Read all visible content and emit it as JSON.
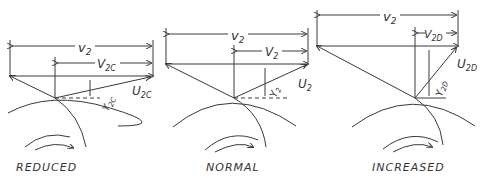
{
  "diagrams": [
    {
      "caption": "REDUCED",
      "labels": {
        "v2": "v",
        "v2_sub": "2",
        "V": "V",
        "V_sub": "2C",
        "U": "U",
        "U_sub": "2C",
        "Y": "Y",
        "Y_sub": "2C"
      }
    },
    {
      "caption": "NORMAL",
      "labels": {
        "v2": "v",
        "v2_sub": "2",
        "V": "V",
        "V_sub": "2",
        "U": "U",
        "U_sub": "2",
        "Y": "Y",
        "Y_sub": "2"
      }
    },
    {
      "caption": "INCREASED",
      "labels": {
        "v2": "v",
        "v2_sub": "2",
        "V": "V",
        "V_sub": "2D",
        "U": "U",
        "U_sub": "2D",
        "Y": "Y",
        "Y_sub": "2D"
      }
    }
  ]
}
